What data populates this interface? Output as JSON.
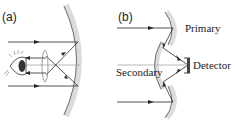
{
  "panels": [
    {
      "id": "a",
      "label": "(a)"
    },
    {
      "id": "b",
      "label": "(b)",
      "annotations": {
        "primary": "Primary",
        "secondary": "Secondary",
        "detector": "Detector"
      }
    }
  ],
  "colors": {
    "ray": "#2a2a2a",
    "mirror": "#d9d9d9",
    "mirror_edge": "#555555",
    "axis": "#9a9a9a"
  }
}
